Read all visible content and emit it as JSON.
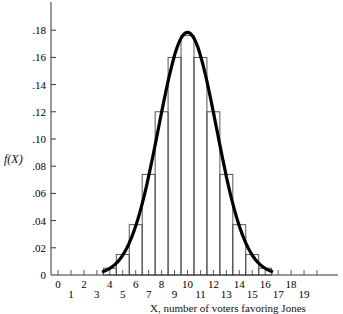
{
  "chart_data": {
    "type": "bar",
    "subtype": "histogram with normal curve overlay",
    "title": "",
    "xlabel": "X, number of voters favoring Jones",
    "ylabel": "f(X)",
    "x": [
      4,
      5,
      6,
      7,
      8,
      9,
      10,
      11,
      12,
      13,
      14,
      15,
      16
    ],
    "values": [
      0.005,
      0.015,
      0.037,
      0.074,
      0.12,
      0.16,
      0.176,
      0.16,
      0.12,
      0.074,
      0.037,
      0.015,
      0.005
    ],
    "curve": {
      "type": "normal",
      "mean": 10,
      "sd": 2.236
    },
    "xlim": [
      0,
      20
    ],
    "ylim": [
      0,
      0.2
    ],
    "xticks": [
      "0",
      "1",
      "2",
      "3",
      "4",
      "5",
      "6",
      "7",
      "8",
      "9",
      "10",
      "11",
      "12",
      "13",
      "14",
      "15",
      "16",
      "17",
      "18",
      "19"
    ],
    "yticks": [
      "0",
      ".02",
      ".04",
      ".06",
      ".08",
      ".10",
      ".12",
      ".14",
      ".16",
      ".18"
    ],
    "grid": false,
    "legend": null
  }
}
